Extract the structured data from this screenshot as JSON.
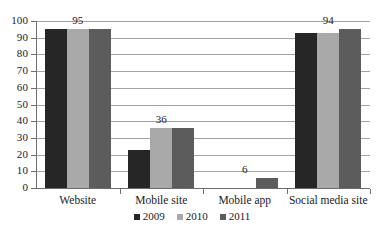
{
  "chart_data": {
    "type": "bar",
    "title": "",
    "xlabel": "",
    "ylabel": "",
    "ylim": [
      0,
      100
    ],
    "y_ticks": [
      0,
      10,
      20,
      30,
      40,
      50,
      60,
      70,
      80,
      90,
      100
    ],
    "y_tick_labels": [
      "0",
      "10",
      "20",
      "30",
      "40",
      "50",
      "60",
      "70",
      "80",
      "90",
      "100"
    ],
    "grid": true,
    "legend_position": "bottom",
    "categories": [
      "Website",
      "Mobile site",
      "Mobile app",
      "Social media site"
    ],
    "series": [
      {
        "name": "2009",
        "color": "#262626",
        "values": [
          95,
          23,
          null,
          93
        ]
      },
      {
        "name": "2010",
        "color": "#a9a9a9",
        "values": [
          95,
          36,
          null,
          93
        ]
      },
      {
        "name": "2011",
        "color": "#5c5c5c",
        "values": [
          95,
          36,
          6,
          95
        ]
      }
    ],
    "data_labels": [
      {
        "category": "Website",
        "text": "95"
      },
      {
        "category": "Mobile site",
        "text": "36"
      },
      {
        "category": "Mobile app",
        "text": "6"
      },
      {
        "category": "Social media site",
        "text": "94"
      }
    ]
  },
  "legend": {
    "items": [
      {
        "label": "2009"
      },
      {
        "label": "2010"
      },
      {
        "label": "2011"
      }
    ]
  }
}
